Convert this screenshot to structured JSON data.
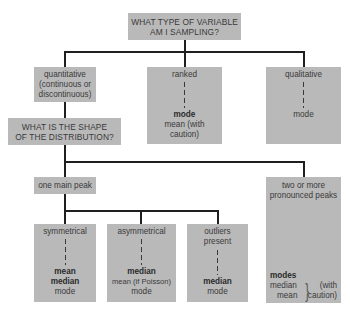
{
  "title": {
    "line1": "WHAT TYPE OF VARIABLE",
    "line2": "AM I SAMPLING?"
  },
  "variable_types": {
    "quantitative": {
      "line1": "quantitative",
      "line2": "(continuous or",
      "line3": "discontinuous)"
    },
    "ranked": {
      "label": "ranked",
      "primary": "mode",
      "secondary_line1": "mean (with",
      "secondary_line2": "caution)"
    },
    "qualitative": {
      "label": "qualitative",
      "primary": "mode"
    }
  },
  "shape_question": {
    "line1": "WHAT IS THE SHAPE",
    "line2": "OF THE DISTRIBUTION?"
  },
  "peaks": {
    "one": {
      "label": "one main peak"
    },
    "multiple": {
      "line1": "two or more",
      "line2": "pronounced peaks",
      "primary": "modes",
      "secondary1": "median",
      "secondary2": "mean",
      "caveat_line1": "(with",
      "caveat_line2": "caution)"
    }
  },
  "distributions": {
    "symmetrical": {
      "label": "symmetrical",
      "bold1": "mean",
      "bold2": "median",
      "normal1": "mode"
    },
    "asymmetrical": {
      "label": "asymmetrical",
      "bold1": "median",
      "normal1": "mean (if Poisson)",
      "normal2": "mode"
    },
    "outliers": {
      "line1": "outliers",
      "line2": "present",
      "bold1": "median",
      "normal1": "mode"
    }
  },
  "colors": {
    "box_fill": "#b9b9b9",
    "connector": "#1f1f1f",
    "text": "#3a3a3a"
  }
}
